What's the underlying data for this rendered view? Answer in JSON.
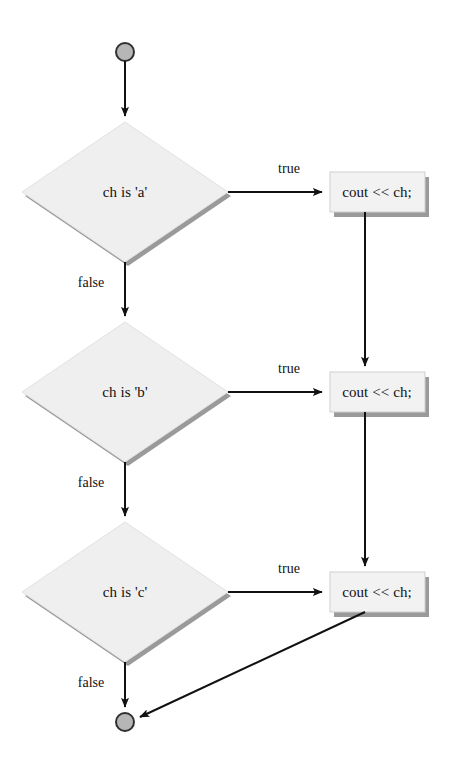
{
  "diagram": {
    "type": "flowchart",
    "colors": {
      "shape_fill": "#efefef",
      "shape_fill_light": "#f2f2f2",
      "shape_shadow": "#9a9a9a",
      "terminator_fill": "#b6b6b6",
      "terminator_stroke": "#303030",
      "line": "#111111",
      "text": "#111111",
      "background": "#ffffff"
    },
    "nodes": [
      {
        "id": "start",
        "kind": "terminator-start",
        "label": "",
        "cx": 125,
        "cy": 52,
        "r": 9
      },
      {
        "id": "decision-a",
        "kind": "decision",
        "label": "ch is 'a'",
        "cx": 125,
        "cy": 192,
        "w": 206,
        "h": 140
      },
      {
        "id": "process-a",
        "kind": "process",
        "label": "cout << ch;",
        "x": 330,
        "y": 172,
        "w": 95,
        "h": 40
      },
      {
        "id": "decision-b",
        "kind": "decision",
        "label": "ch is 'b'",
        "cx": 125,
        "cy": 392,
        "w": 206,
        "h": 140
      },
      {
        "id": "process-b",
        "kind": "process",
        "label": "cout << ch;",
        "x": 330,
        "y": 372,
        "w": 95,
        "h": 40
      },
      {
        "id": "decision-c",
        "kind": "decision",
        "label": "ch is 'c'",
        "cx": 125,
        "cy": 592,
        "w": 206,
        "h": 140
      },
      {
        "id": "process-c",
        "kind": "process",
        "label": "cout << ch;",
        "x": 330,
        "y": 572,
        "w": 95,
        "h": 40
      },
      {
        "id": "end",
        "kind": "terminator-end",
        "label": "",
        "cx": 125,
        "cy": 722,
        "r": 9
      }
    ],
    "edges": [
      {
        "id": "start-to-a",
        "label": "",
        "from": "start",
        "to": "decision-a"
      },
      {
        "id": "a-true",
        "label": "true",
        "from": "decision-a",
        "to": "process-a",
        "label_x": 289,
        "label_y": 169
      },
      {
        "id": "a-false",
        "label": "false",
        "from": "decision-a",
        "to": "decision-b",
        "label_x": 91,
        "label_y": 283
      },
      {
        "id": "pa-to-pb",
        "label": "",
        "from": "process-a",
        "to": "process-b"
      },
      {
        "id": "b-true",
        "label": "true",
        "from": "decision-b",
        "to": "process-b",
        "label_x": 289,
        "label_y": 369
      },
      {
        "id": "b-false",
        "label": "false",
        "from": "decision-b",
        "to": "decision-c",
        "label_x": 91,
        "label_y": 483
      },
      {
        "id": "pb-to-pc",
        "label": "",
        "from": "process-b",
        "to": "process-c"
      },
      {
        "id": "c-true",
        "label": "true",
        "from": "decision-c",
        "to": "process-c",
        "label_x": 289,
        "label_y": 569
      },
      {
        "id": "c-false",
        "label": "false",
        "from": "decision-c",
        "to": "end",
        "label_x": 91,
        "label_y": 683
      },
      {
        "id": "pc-to-end",
        "label": "",
        "from": "process-c",
        "to": "end"
      }
    ]
  }
}
